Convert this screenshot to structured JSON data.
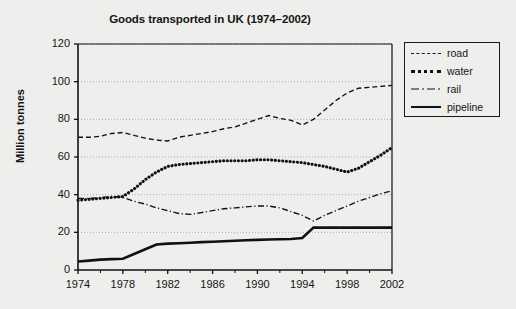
{
  "chart_data": {
    "type": "line",
    "title": "Goods transported in UK (1974–2002)",
    "xlabel": "",
    "ylabel": "Million tonnes",
    "xlim": [
      1974,
      2002
    ],
    "ylim": [
      0,
      120
    ],
    "ytick_values": [
      0,
      20,
      40,
      60,
      80,
      100,
      120
    ],
    "ytick_labels": [
      "0",
      "20",
      "40",
      "60",
      "80",
      "100",
      "120"
    ],
    "xtick_values": [
      1974,
      1978,
      1982,
      1986,
      1990,
      1994,
      1998,
      2002
    ],
    "xtick_labels": [
      "1974",
      "1978",
      "1982",
      "1986",
      "1990",
      "1994",
      "1998",
      "2002"
    ],
    "grid": "horizontal-dotted",
    "legend_position": "right-outside",
    "x": [
      1974,
      1975,
      1976,
      1977,
      1978,
      1979,
      1980,
      1981,
      1982,
      1983,
      1984,
      1985,
      1986,
      1987,
      1988,
      1989,
      1990,
      1991,
      1992,
      1993,
      1994,
      1995,
      1996,
      1997,
      1998,
      1999,
      2000,
      2001,
      2002
    ],
    "series": [
      {
        "name": "road",
        "style": "dashed",
        "color": "#111111",
        "values": [
          70.5,
          70.5,
          71.0,
          72.5,
          73.0,
          71.5,
          70.0,
          69.0,
          68.5,
          70.5,
          71.5,
          72.5,
          73.5,
          75.0,
          76.0,
          78.0,
          80.0,
          82.0,
          80.5,
          79.5,
          77.0,
          80.0,
          85.0,
          90.0,
          94.0,
          96.5,
          97.0,
          97.5,
          98.0
        ]
      },
      {
        "name": "water",
        "style": "dotted",
        "color": "#111111",
        "values": [
          37.0,
          37.5,
          38.0,
          38.5,
          39.0,
          43.0,
          48.0,
          52.0,
          55.0,
          56.0,
          56.5,
          57.0,
          57.5,
          58.0,
          58.0,
          58.0,
          58.5,
          58.5,
          58.0,
          57.5,
          57.0,
          56.0,
          55.0,
          53.5,
          52.0,
          54.0,
          57.5,
          61.0,
          65.0
        ]
      },
      {
        "name": "rail",
        "style": "dash-dot",
        "color": "#111111",
        "values": [
          38.0,
          38.0,
          38.5,
          39.0,
          38.5,
          36.5,
          35.0,
          33.0,
          31.5,
          30.0,
          29.5,
          30.5,
          31.5,
          32.5,
          33.0,
          33.5,
          34.0,
          34.0,
          33.0,
          31.0,
          29.0,
          26.0,
          29.0,
          31.5,
          34.0,
          36.5,
          38.5,
          40.5,
          42.0
        ]
      },
      {
        "name": "pipeline",
        "style": "solid",
        "color": "#111111",
        "values": [
          4.5,
          5.0,
          5.5,
          5.8,
          6.0,
          8.5,
          11.0,
          13.5,
          14.0,
          14.2,
          14.5,
          14.8,
          15.0,
          15.3,
          15.5,
          15.8,
          16.0,
          16.2,
          16.3,
          16.5,
          17.0,
          22.5,
          22.5,
          22.5,
          22.5,
          22.5,
          22.5,
          22.5,
          22.5
        ]
      }
    ]
  },
  "legend": {
    "items": [
      {
        "label": "road",
        "key": "dashed-line-key"
      },
      {
        "label": "water",
        "key": "dotted-line-key"
      },
      {
        "label": "rail",
        "key": "dash-dot-line-key"
      },
      {
        "label": "pipeline",
        "key": "solid-line-key"
      }
    ]
  }
}
